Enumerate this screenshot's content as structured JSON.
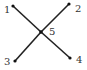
{
  "diagram": {
    "type": "graph",
    "colors": {
      "line": "#222222",
      "node": "#111111",
      "label": "#333333",
      "background": "#ffffff"
    },
    "nodes": [
      {
        "id": "1",
        "label": "1",
        "x": 13,
        "y": 6,
        "label_x": 4,
        "label_y": 13
      },
      {
        "id": "2",
        "label": "2",
        "x": 69,
        "y": 4,
        "label_x": 75,
        "label_y": 12
      },
      {
        "id": "3",
        "label": "3",
        "x": 15,
        "y": 61,
        "label_x": 4,
        "label_y": 65
      },
      {
        "id": "4",
        "label": "4",
        "x": 70,
        "y": 58,
        "label_x": 76,
        "label_y": 63
      },
      {
        "id": "5",
        "label": "5",
        "x": 41,
        "y": 32,
        "label_x": 49,
        "label_y": 35
      }
    ],
    "edges": [
      {
        "from": "1",
        "to": "5"
      },
      {
        "from": "5",
        "to": "4"
      },
      {
        "from": "2",
        "to": "5"
      },
      {
        "from": "5",
        "to": "3"
      }
    ]
  }
}
